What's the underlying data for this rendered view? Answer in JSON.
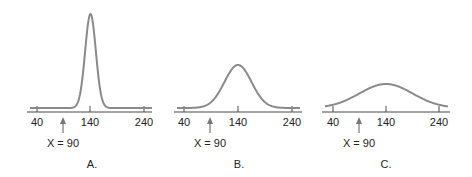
{
  "chart_data": [
    {
      "type": "line",
      "panel": "A.",
      "title": "",
      "xlabel": "",
      "ylabel": "",
      "x_ticks": [
        40,
        140,
        240
      ],
      "xlim": [
        40,
        240
      ],
      "mean": 140,
      "spread": "narrow",
      "sd_approx": 10,
      "marker": {
        "label": "X = 90",
        "x": 90
      },
      "grid": false
    },
    {
      "type": "line",
      "panel": "B.",
      "title": "",
      "xlabel": "",
      "ylabel": "",
      "x_ticks": [
        40,
        140,
        240
      ],
      "xlim": [
        40,
        240
      ],
      "mean": 140,
      "spread": "medium",
      "sd_approx": 25,
      "marker": {
        "label": "X = 90",
        "x": 90
      },
      "grid": false
    },
    {
      "type": "line",
      "panel": "C.",
      "title": "",
      "xlabel": "",
      "ylabel": "",
      "x_ticks": [
        40,
        140,
        240
      ],
      "xlim": [
        40,
        240
      ],
      "mean": 140,
      "spread": "wide",
      "sd_approx": 50,
      "marker": {
        "label": "X = 90",
        "x": 90
      },
      "grid": false
    }
  ],
  "panels": [
    {
      "label": "A.",
      "ticks": [
        "40",
        "140",
        "240"
      ],
      "marker": "X = 90"
    },
    {
      "label": "B.",
      "ticks": [
        "40",
        "140",
        "240"
      ],
      "marker": "X = 90"
    },
    {
      "label": "C.",
      "ticks": [
        "40",
        "140",
        "240"
      ],
      "marker": "X = 90"
    }
  ],
  "colors": {
    "curve": "#8a8a8a",
    "axis": "#4a4a4a",
    "text": "#222222"
  }
}
